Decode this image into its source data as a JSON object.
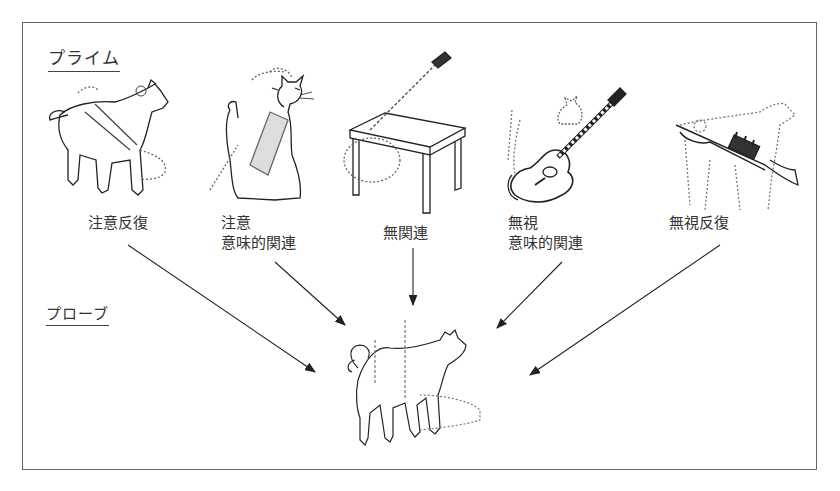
{
  "section_labels": {
    "prime": "プライム",
    "probe": "プローブ"
  },
  "primes": [
    {
      "id": "attended-repetition",
      "line1": "注意反復",
      "line2": "",
      "image": "dog-icon"
    },
    {
      "id": "attended-semantic",
      "line1": "注意",
      "line2": "意味的関連",
      "image": "cat-icon"
    },
    {
      "id": "unrelated",
      "line1": "無関連",
      "line2": "",
      "image": "table-icon"
    },
    {
      "id": "ignored-semantic",
      "line1": "無視",
      "line2": "意味的関連",
      "image": "guitar-icon"
    },
    {
      "id": "ignored-repetition",
      "line1": "無視反復",
      "line2": "",
      "image": "trumpet-icon"
    }
  ],
  "probe": {
    "image": "dog-icon"
  },
  "colors": {
    "line": "#222222",
    "dotted": "#666666",
    "frame": "#666666"
  }
}
